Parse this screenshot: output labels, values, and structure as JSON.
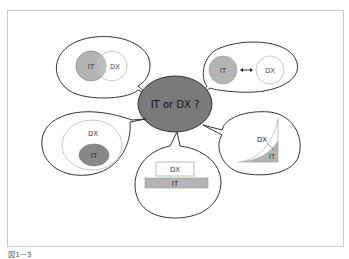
{
  "diagram": {
    "center": {
      "label": "IT or DX ?",
      "fill": "#7a7a7a"
    },
    "bubbles": [
      {
        "id": "overlap",
        "position": "top-left",
        "labels": {
          "it": "IT",
          "dx": "DX"
        },
        "relation": "partially overlapping"
      },
      {
        "id": "separate",
        "position": "top-right",
        "labels": {
          "it": "IT",
          "dx": "DX"
        },
        "relation": "separate with bidirectional arrow"
      },
      {
        "id": "contains",
        "position": "middle-left",
        "labels": {
          "it": "IT",
          "dx": "DX"
        },
        "relation": "IT contained in DX"
      },
      {
        "id": "foundation",
        "position": "bottom-center",
        "labels": {
          "it": "IT",
          "dx": "DX"
        },
        "relation": "IT as base under DX"
      },
      {
        "id": "growth",
        "position": "middle-right",
        "labels": {
          "it": "IT",
          "dx": "DX"
        },
        "relation": "DX growth curve above IT area"
      }
    ],
    "colors": {
      "it_fill": "#b4b4b4",
      "dx_stroke": "#c8c8c8",
      "bubble_stroke": "#333333",
      "center_fill": "#7a7a7a"
    }
  },
  "caption": "図1－3"
}
